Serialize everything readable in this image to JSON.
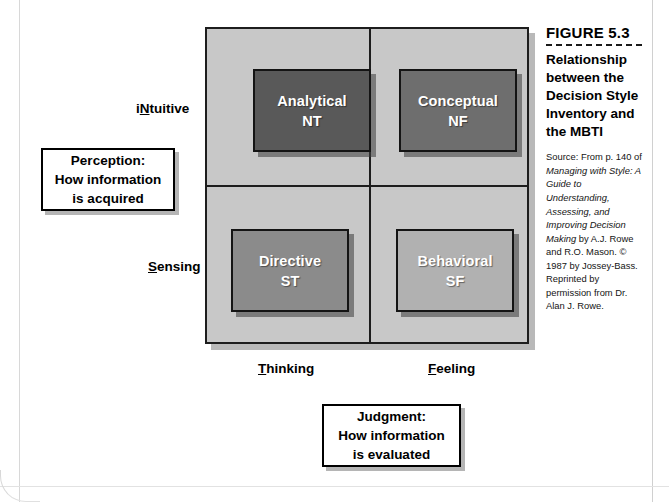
{
  "figure": {
    "number_label": "FIGURE 5.3",
    "title": "Relationship between the Decision Style Inventory and the MBTI",
    "source_prefix": "Source: From p. 140 of ",
    "source_italic": "Managing with Style: A Guide to Understanding, Assessing, and Improving Decision Making",
    "source_suffix": " by A.J. Rowe and R.O. Mason. © 1987 by Jossey-Bass. Reprinted by permission from Dr. Alan J. Rowe."
  },
  "matrix": {
    "quadrants": [
      {
        "name": "Analytical",
        "code": "NT",
        "color": "#595959"
      },
      {
        "name": "Conceptual",
        "code": "NF",
        "color": "#6e6e6e"
      },
      {
        "name": "Directive",
        "code": "ST",
        "color": "#8b8b8b"
      },
      {
        "name": "Behavioral",
        "code": "SF",
        "color": "#b1b1b1"
      }
    ],
    "background_color": "#c8c8c8"
  },
  "axes": {
    "row_top": {
      "prefix": "i",
      "underlined": "N",
      "suffix": "tuitive"
    },
    "row_bottom": {
      "prefix": "",
      "underlined": "S",
      "suffix": "ensing"
    },
    "col_left": {
      "prefix": "",
      "underlined": "T",
      "suffix": "hinking"
    },
    "col_right": {
      "prefix": "",
      "underlined": "F",
      "suffix": "eeling"
    }
  },
  "callouts": {
    "perception": {
      "line1": "Perception:",
      "line2": "How information",
      "line3": "is acquired"
    },
    "judgment": {
      "line1": "Judgment:",
      "line2": "How information",
      "line3": "is evaluated"
    }
  }
}
